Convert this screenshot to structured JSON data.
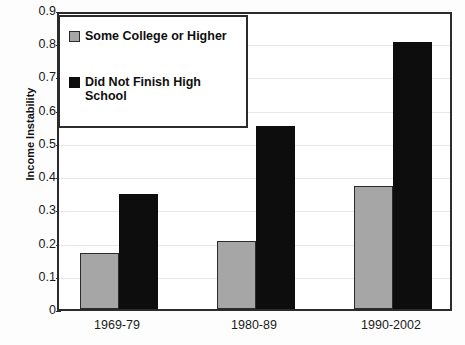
{
  "chart_data": {
    "type": "bar",
    "title": "",
    "xlabel": "",
    "ylabel": "Income Instability",
    "categories": [
      "1969-79",
      "1980-89",
      "1990-2002"
    ],
    "series": [
      {
        "name": "Some College or Higher",
        "values": [
          0.17,
          0.205,
          0.37
        ],
        "color": "#a6a6a6"
      },
      {
        "name": "Did Not Finish High School",
        "values": [
          0.345,
          0.55,
          0.805
        ],
        "color": "#0d0d0d"
      }
    ],
    "ylim": [
      0,
      0.9
    ],
    "y_ticks": [
      "0",
      "0.1",
      "0.2",
      "0.3",
      "0.4",
      "0.5",
      "0.6",
      "0.7",
      "0.8",
      "0.9"
    ],
    "y_tick_values": [
      0,
      0.1,
      0.2,
      0.3,
      0.4,
      0.5,
      0.6,
      0.7,
      0.8,
      0.9
    ],
    "grid": true,
    "legend_position": "top-left"
  },
  "axis": {
    "y_title": "Income Instability"
  },
  "legend": {
    "entries": [
      {
        "label": "Some College or Higher"
      },
      {
        "label": "Did Not Finish High School"
      }
    ]
  }
}
